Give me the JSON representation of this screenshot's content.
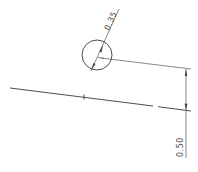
{
  "drawing": {
    "type": "technical-drawing",
    "line_color": "#3a3a3a",
    "background": "#ffffff",
    "dimensions": [
      {
        "id": "hole-diameter",
        "label": "0.35",
        "kind": "diameter"
      },
      {
        "id": "hole-offset",
        "label": "0.50",
        "kind": "linear-vertical"
      }
    ]
  }
}
